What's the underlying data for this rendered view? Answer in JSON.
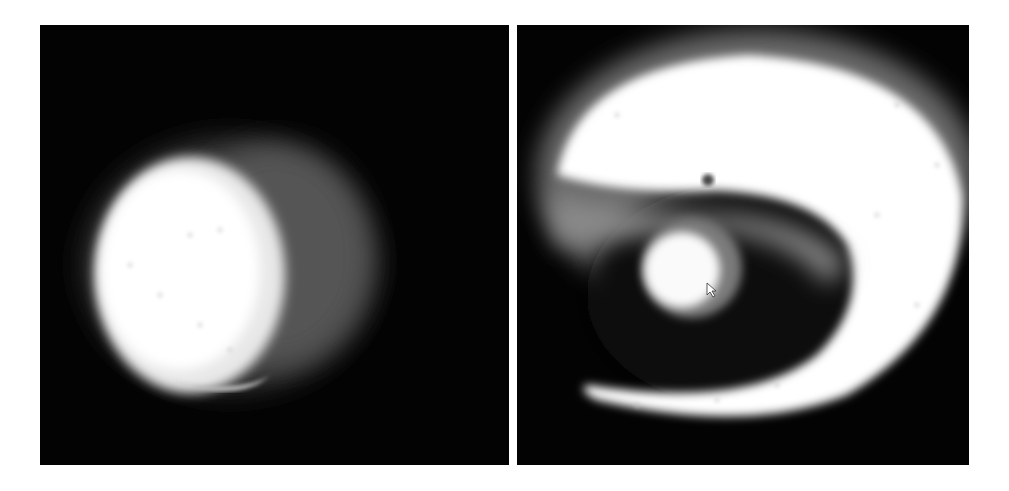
{
  "figure": {
    "panels": [
      {
        "id": "left",
        "description": "bright ovoid blob with dim grey halo on right side, on black background"
      },
      {
        "id": "right",
        "description": "large bright spiral/crescent shape wrapping around a small bright disc, on black background"
      }
    ],
    "colors": {
      "background": "#030303",
      "bright": "#ffffff",
      "page": "#ffffff"
    }
  }
}
